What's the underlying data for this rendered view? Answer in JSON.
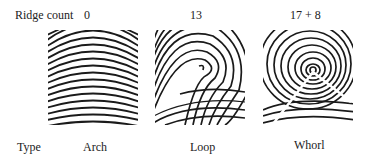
{
  "row_labels": {
    "ridge_count": "Ridge count",
    "type": "Type"
  },
  "patterns": [
    {
      "type": "Arch",
      "ridge_count": "0",
      "icon": "arch-fingerprint-icon"
    },
    {
      "type": "Loop",
      "ridge_count": "13",
      "icon": "loop-fingerprint-icon"
    },
    {
      "type": "Whorl",
      "ridge_count": "17 + 8",
      "icon": "whorl-fingerprint-icon"
    }
  ],
  "colors": {
    "ridge": "#1a1a1a",
    "background": "#ffffff"
  }
}
